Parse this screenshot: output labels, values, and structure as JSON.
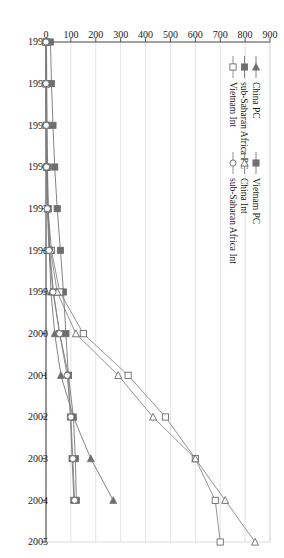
{
  "chart_data": {
    "type": "line",
    "title": "",
    "subtitle": "",
    "xlabel": "",
    "ylabel": "",
    "x": [
      1993,
      1994,
      1995,
      1996,
      1997,
      1998,
      1999,
      2000,
      2001,
      2002,
      2003,
      2004,
      2005
    ],
    "xtick_labels": [
      "1993",
      "1994",
      "1995",
      "1996",
      "1997",
      "1998",
      "1999",
      "2000",
      "2001",
      "2002",
      "2003",
      "2004",
      "2005"
    ],
    "ytick_labels": [
      "0",
      "100",
      "200",
      "300",
      "400",
      "500",
      "600",
      "700",
      "800",
      "900"
    ],
    "ylim": [
      0,
      900
    ],
    "ytick_step": 100,
    "grid": "vertical-only",
    "legend_position": "inside-left",
    "series": [
      {
        "name": "China PC",
        "marker": "triangle-left-filled",
        "color": "#6e6e6e",
        "values": [
          2,
          3,
          4,
          6,
          9,
          13,
          20,
          35,
          60,
          110,
          180,
          270,
          null
        ]
      },
      {
        "name": "sub-Saharan Africa PC",
        "marker": "square-filled",
        "color": "#6e6e6e",
        "values": [
          18,
          22,
          28,
          35,
          45,
          58,
          70,
          80,
          90,
          98,
          105,
          112,
          null
        ]
      },
      {
        "name": "Vietnam Int",
        "marker": "square-open",
        "color": "#808080",
        "values": [
          0,
          0,
          1,
          3,
          8,
          22,
          55,
          150,
          330,
          480,
          600,
          680,
          700
        ]
      },
      {
        "name": "Vietnam PC",
        "marker": "square-filled-dark",
        "color": "#707070",
        "values": [
          1,
          2,
          3,
          5,
          8,
          15,
          30,
          55,
          90,
          110,
          118,
          122,
          null
        ]
      },
      {
        "name": "China Int",
        "marker": "triangle-left-open",
        "color": "#808080",
        "values": [
          0,
          0,
          1,
          2,
          6,
          18,
          45,
          120,
          290,
          430,
          600,
          720,
          840
        ]
      },
      {
        "name": "sub-Saharan Africa Int",
        "marker": "circle-open",
        "color": "#808080",
        "values": [
          0,
          0,
          1,
          2,
          5,
          12,
          28,
          55,
          85,
          100,
          108,
          115,
          null
        ]
      }
    ],
    "legend_columns": [
      [
        "China PC",
        "sub-Saharan Africa PC",
        "Vietnam Int"
      ],
      [
        "Vietnam PC",
        "China Int",
        "sub-Saharan Africa Int"
      ]
    ]
  },
  "axes": {
    "x_axis_name": "year-axis",
    "y_axis_name": "value-axis"
  }
}
